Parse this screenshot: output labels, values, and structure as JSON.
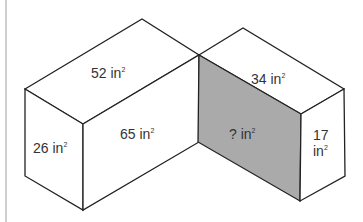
{
  "diagram": {
    "colors": {
      "stroke": "#222222",
      "unknown_face_fill": "#aaaaaa",
      "background": "#ffffff"
    },
    "left_prism": {
      "top_face": {
        "value": "52",
        "unit": "in",
        "exp": "2"
      },
      "side_face": {
        "value": "26",
        "unit": "in",
        "exp": "2"
      },
      "front_face": {
        "value": "65",
        "unit": "in",
        "exp": "2"
      }
    },
    "right_prism": {
      "top_face": {
        "value": "34",
        "unit": "in",
        "exp": "2"
      },
      "front_face": {
        "value": "?",
        "unit": "in",
        "exp": "2"
      },
      "side_face_line1": "17",
      "side_face_line2": {
        "unit": "in",
        "exp": "2"
      }
    }
  }
}
